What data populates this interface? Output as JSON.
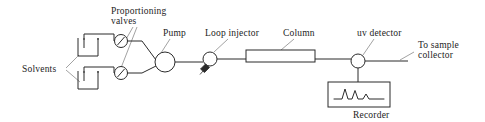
{
  "diagram": {
    "labels": {
      "proportioning_valves_line1": "Proportioning",
      "proportioning_valves_line2": "valves",
      "solvents": "Solvents",
      "pump": "Pump",
      "loop_injector": "Loop injector",
      "column": "Column",
      "uv_detector": "uv detector",
      "to_sample_line1": "To sample",
      "to_sample_line2": "collector",
      "recorder": "Recorder"
    },
    "components": [
      {
        "id": "solvent-reservoir-top",
        "kind": "beaker"
      },
      {
        "id": "solvent-reservoir-bottom",
        "kind": "beaker"
      },
      {
        "id": "proportioning-valve-top",
        "kind": "valve-circle-slash"
      },
      {
        "id": "proportioning-valve-bottom",
        "kind": "valve-circle-slash"
      },
      {
        "id": "pump",
        "kind": "circle"
      },
      {
        "id": "loop-injector",
        "kind": "circle-with-syringe"
      },
      {
        "id": "column",
        "kind": "rectangle"
      },
      {
        "id": "uv-detector",
        "kind": "circle"
      },
      {
        "id": "recorder",
        "kind": "box-with-chromatogram"
      }
    ],
    "colors": {
      "line": "#2b2b2b",
      "leader": "#8a8a8a",
      "text": "#1c1c1c",
      "background": "#ffffff"
    },
    "chromatogram": {
      "peak_count": 3,
      "peak_heights_relative": [
        1.0,
        0.85,
        0.5
      ]
    }
  }
}
